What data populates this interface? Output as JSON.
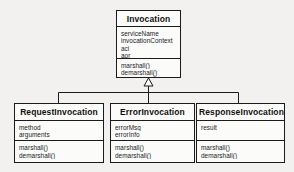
{
  "diagram": {
    "type": "uml-class-diagram",
    "relationship": "generalization",
    "background_color": "#f2f1ef",
    "line_color": "#1b1b1b",
    "box_fill_color": "#fbfbfa"
  },
  "classes": {
    "invocation": {
      "name": "Invocation",
      "attributes": [
        "serviceName",
        "invocationContext",
        "aci",
        "aor"
      ],
      "operations": [
        "marshall()",
        "demarshall()"
      ]
    },
    "request": {
      "name": "RequestInvocation",
      "attributes": [
        "method",
        "arguments"
      ],
      "operations": [
        "marshall()",
        "demarshall()"
      ]
    },
    "error": {
      "name": "ErrorInvocation",
      "attributes": [
        "errorMsg",
        "errorInfo"
      ],
      "operations": [
        "marshall()",
        "demarshall()"
      ]
    },
    "response": {
      "name": "ResponseInvocation",
      "attributes": [
        "result"
      ],
      "operations": [
        "marshall()",
        "demarshall()"
      ]
    }
  }
}
